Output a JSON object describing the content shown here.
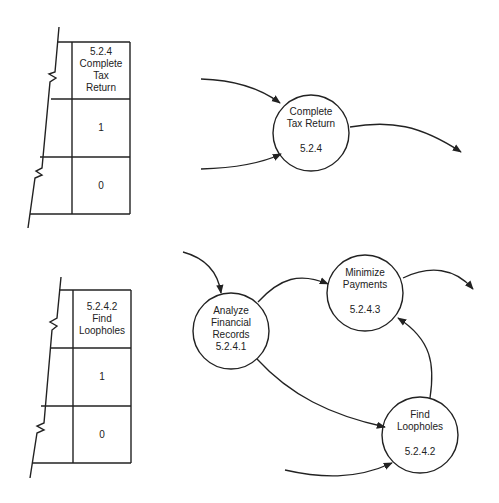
{
  "tables": [
    {
      "header": [
        "5.2.4",
        "Complete",
        "Tax",
        "Return"
      ],
      "rows": [
        "1",
        "0"
      ]
    },
    {
      "header": [
        "5.2.4.2",
        "Find",
        "Loopholes"
      ],
      "rows": [
        "1",
        "0"
      ]
    }
  ],
  "nodes": {
    "complete_tax_return": {
      "lines": [
        "Complete",
        "Tax Return"
      ],
      "id": "5.2.4"
    },
    "analyze_financial_records": {
      "lines": [
        "Analyze",
        "Financial",
        "Records"
      ],
      "id": "5.2.4.1"
    },
    "minimize_payments": {
      "lines": [
        "Minimize",
        "Payments"
      ],
      "id": "5.2.4.3"
    },
    "find_loopholes": {
      "lines": [
        "Find",
        "Loopholes"
      ],
      "id": "5.2.4.2"
    }
  },
  "colors": {
    "stroke": "#222222",
    "background": "#ffffff"
  }
}
